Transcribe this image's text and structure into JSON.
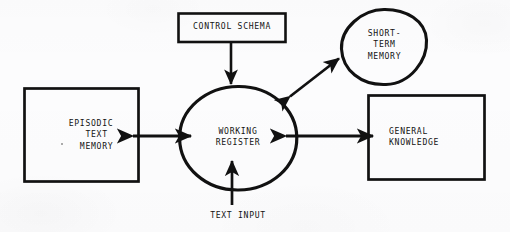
{
  "diagram": {
    "type": "block-diagram",
    "canvas": {
      "width": 510,
      "height": 232
    },
    "ink_color": "#111111",
    "paper_color": "#fcfcfd",
    "nodes": {
      "control_schema": {
        "label": "CONTROL SCHEMA",
        "shape": "rectangle"
      },
      "short_term_memory": {
        "label": "SHORT-\nTERM\nMEMORY",
        "shape": "ellipse"
      },
      "episodic_text_memory": {
        "label": "EPISODIC\n  TEXT\n  MEMORY",
        "shape": "rectangle"
      },
      "working_register": {
        "label": "WORKING\nREGISTER",
        "shape": "ellipse"
      },
      "general_knowledge": {
        "label": "GENERAL\nKNOWLEDGE",
        "shape": "rectangle"
      },
      "text_input": {
        "label": "TEXT INPUT",
        "shape": "none"
      }
    },
    "edges": [
      {
        "from": "control_schema",
        "to": "working_register",
        "direction": "one-way",
        "orientation": "vertical-down"
      },
      {
        "from": "working_register",
        "to": "short_term_memory",
        "direction": "bidirectional",
        "orientation": "diagonal-up-right"
      },
      {
        "from": "episodic_text_memory",
        "to": "working_register",
        "direction": "bidirectional",
        "orientation": "horizontal"
      },
      {
        "from": "working_register",
        "to": "general_knowledge",
        "direction": "bidirectional",
        "orientation": "horizontal"
      },
      {
        "from": "text_input",
        "to": "working_register",
        "direction": "one-way",
        "orientation": "vertical-up"
      }
    ]
  }
}
